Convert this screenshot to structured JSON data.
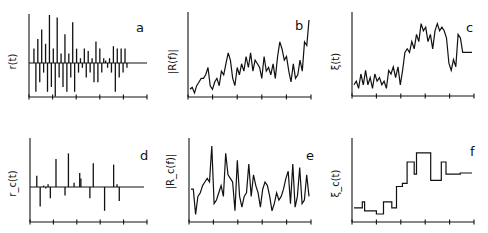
{
  "figure": {
    "panels": [
      {
        "id": "a",
        "letter": "a",
        "ylabel": "r(t)"
      },
      {
        "id": "b",
        "letter": "b",
        "ylabel": "|R(f)|"
      },
      {
        "id": "c",
        "letter": "c",
        "ylabel": "ξ(t)"
      },
      {
        "id": "d",
        "letter": "d",
        "ylabel": "r_c(t)"
      },
      {
        "id": "e",
        "letter": "e",
        "ylabel": "|R_c(f)|"
      },
      {
        "id": "f",
        "letter": "f",
        "ylabel": "ξ_c(t)"
      }
    ]
  },
  "chart_data": [
    {
      "panel": "a",
      "type": "line",
      "title": "",
      "ylabel": "r(t)",
      "xlabel": "",
      "description": "Dense bipolar spike train decaying in amplitude over time",
      "x_ticks": 6,
      "grid": false,
      "values": [
        0,
        0.3,
        -0.6,
        0.5,
        -0.4,
        0.7,
        -0.2,
        0.4,
        -0.6,
        1.0,
        -0.5,
        0.3,
        -0.7,
        0.95,
        -0.3,
        0.2,
        -0.5,
        0.6,
        -0.6,
        0.2,
        -0.3,
        0.85,
        -0.6,
        0.3,
        -0.2,
        0.1,
        -0.1,
        0.3,
        -0.3,
        0.25,
        -0.2,
        0.1,
        -0.4,
        0.45,
        -0.4,
        0.3,
        -0.2,
        0.1,
        0.05,
        -0.1,
        0.1,
        -0.2,
        0.35,
        -0.6,
        0.3,
        -0.3,
        0.3,
        -0.2,
        0.3,
        -0.1,
        0
      ]
    },
    {
      "panel": "b",
      "type": "line",
      "title": "",
      "ylabel": "|R(f)|",
      "xlabel": "",
      "description": "Noisy magnitude spectrum, rising sharply at the right end",
      "x_ticks": 6,
      "grid": false,
      "values": [
        0.05,
        0.08,
        0.0,
        0.1,
        0.15,
        0.2,
        0.2,
        0.25,
        0.35,
        0.1,
        0.05,
        0.15,
        0.2,
        0.1,
        0.3,
        0.25,
        0.4,
        0.55,
        0.45,
        0.2,
        0.1,
        0.35,
        0.25,
        0.4,
        0.3,
        0.5,
        0.35,
        0.55,
        0.3,
        0.45,
        0.4,
        0.35,
        0.2,
        0.5,
        0.3,
        0.35,
        0.25,
        0.4,
        0.2,
        0.5,
        0.7,
        0.6,
        0.45,
        0.5,
        0.3,
        0.15,
        0.4,
        0.2,
        0.25,
        0.45,
        0.3,
        0.7,
        0.65,
        1.0
      ]
    },
    {
      "panel": "c",
      "type": "line",
      "title": "",
      "ylabel": "ξ(t)",
      "xlabel": "",
      "description": "Noisy time trajectory stepping from low to high levels, then flat",
      "x_ticks": 6,
      "grid": false,
      "values": [
        0.1,
        0.15,
        0.05,
        0.25,
        0.1,
        0.3,
        0.1,
        0.2,
        0.05,
        0.25,
        0.15,
        0.2,
        0.1,
        0.15,
        0.05,
        0.3,
        0.25,
        0.35,
        0.2,
        0.35,
        0.1,
        0.3,
        0.55,
        0.6,
        0.55,
        0.7,
        0.6,
        0.8,
        0.7,
        0.95,
        0.85,
        0.9,
        0.7,
        0.8,
        0.6,
        0.85,
        0.95,
        0.85,
        0.9,
        0.85,
        0.75,
        0.4,
        0.3,
        0.45,
        0.35,
        0.8,
        0.75,
        0.55,
        0.55,
        0.55,
        0.55,
        0.55
      ]
    },
    {
      "panel": "d",
      "type": "line",
      "title": "",
      "ylabel": "r_c(t)",
      "xlabel": "",
      "description": "Sparse (compressed) spike train",
      "x_ticks": 6,
      "grid": false,
      "spikes": [
        [
          0.06,
          0.4
        ],
        [
          0.09,
          -0.7
        ],
        [
          0.12,
          0.05
        ],
        [
          0.14,
          -0.05
        ],
        [
          0.16,
          0.1
        ],
        [
          0.18,
          -0.4
        ],
        [
          0.23,
          1.0
        ],
        [
          0.31,
          -0.3
        ],
        [
          0.34,
          1.2
        ],
        [
          0.39,
          0.15
        ],
        [
          0.44,
          0.5
        ],
        [
          0.45,
          0.3
        ],
        [
          0.53,
          -0.4
        ],
        [
          0.56,
          0.85
        ],
        [
          0.66,
          -0.85
        ],
        [
          0.74,
          0.8
        ],
        [
          0.77,
          0.1
        ],
        [
          0.79,
          -0.5
        ],
        [
          0.93,
          0.0
        ]
      ]
    },
    {
      "panel": "e",
      "type": "line",
      "title": "",
      "ylabel": "|R_c(f)|",
      "xlabel": "",
      "description": "Noisy magnitude spectrum of compressed signal",
      "x_ticks": 6,
      "grid": false,
      "values": [
        0.4,
        0.4,
        0.05,
        0.3,
        0.35,
        0.45,
        0.5,
        0.55,
        0.5,
        1.0,
        0.2,
        0.25,
        0.35,
        0.45,
        0.3,
        0.9,
        0.6,
        0.55,
        0.5,
        0.1,
        0.8,
        0.3,
        0.15,
        0.3,
        0.35,
        0.75,
        0.3,
        0.6,
        0.45,
        0.35,
        0.15,
        0.4,
        0.5,
        0.45,
        0.3,
        0.1,
        0.2,
        0.35,
        0.25,
        0.3,
        0.4,
        0.55,
        0.65,
        0.2,
        0.75,
        0.15,
        0.3,
        0.7,
        0.2,
        0.25,
        0.6,
        0.3
      ]
    },
    {
      "panel": "f",
      "type": "line",
      "title": "",
      "ylabel": "ξ_c(t)",
      "xlabel": "",
      "description": "Piecewise-constant staircase trajectory",
      "x_ticks": 6,
      "grid": false,
      "steps": [
        [
          0,
          0.1
        ],
        [
          0.07,
          0.2
        ],
        [
          0.09,
          0.05
        ],
        [
          0.19,
          0.0
        ],
        [
          0.25,
          0.2
        ],
        [
          0.32,
          0.1
        ],
        [
          0.36,
          0.45
        ],
        [
          0.41,
          0.5
        ],
        [
          0.45,
          0.85
        ],
        [
          0.51,
          0.65
        ],
        [
          0.53,
          1.0
        ],
        [
          0.65,
          0.55
        ],
        [
          0.74,
          0.85
        ],
        [
          0.78,
          0.65
        ],
        [
          0.9,
          0.67
        ],
        [
          1.0,
          0.67
        ]
      ]
    }
  ]
}
